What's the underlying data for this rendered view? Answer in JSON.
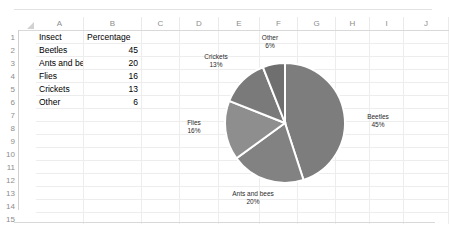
{
  "app": {
    "type": "spreadsheet",
    "column_headers": [
      "A",
      "B",
      "C",
      "D",
      "E",
      "F",
      "G",
      "H",
      "I",
      "J"
    ],
    "row_headers": [
      "1",
      "2",
      "3",
      "4",
      "5",
      "6",
      "7",
      "8",
      "9",
      "10",
      "11",
      "12",
      "13",
      "14",
      "15"
    ]
  },
  "table": {
    "headers": [
      "Insect",
      "Percentage"
    ],
    "rows": [
      {
        "label": "Beetles",
        "value": "45"
      },
      {
        "label": "Ants and bees",
        "value": "20"
      },
      {
        "label": "Flies",
        "value": "16"
      },
      {
        "label": "Crickets",
        "value": "13"
      },
      {
        "label": "Other",
        "value": "6"
      }
    ]
  },
  "chart_data": {
    "type": "pie",
    "title": "",
    "categories": [
      "Beetles",
      "Ants and bees",
      "Flies",
      "Crickets",
      "Other"
    ],
    "values": [
      45,
      20,
      16,
      13,
      6
    ],
    "value_suffix": "%",
    "labels": [
      {
        "name": "Beetles",
        "percent": "45%"
      },
      {
        "name": "Ants and bees",
        "percent": "20%"
      },
      {
        "name": "Flies",
        "percent": "16%"
      },
      {
        "name": "Crickets",
        "percent": "13%"
      },
      {
        "name": "Other",
        "percent": "6%"
      }
    ],
    "legend": "none",
    "data_labels": "outside",
    "start_angle_deg": 0,
    "direction": "clockwise",
    "colors": [
      "#7d7d7d",
      "#828282",
      "#8e8e8e",
      "#7a7a7a",
      "#6f6f6f"
    ],
    "separator_color": "#ffffff",
    "grid": false
  },
  "scrollbar": {
    "orientation": "horizontal",
    "thumb_label": ""
  }
}
